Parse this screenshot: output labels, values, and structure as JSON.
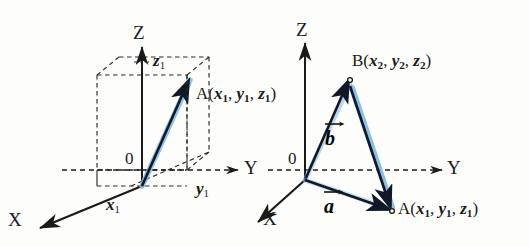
{
  "figure": {
    "caption_clipped": "(x₂ - x₁, y₂ - y₁, z₂ - z₁)",
    "background_color": "#fdfdfc",
    "ink_color": "#1a1a1a",
    "vector_line_color": "#111827",
    "vector_highlight_color": "#7fb8e0",
    "dashed_color": "#2b2b2b"
  },
  "left_diagram": {
    "name": "position-vector-in-box",
    "axes": {
      "z_label": "Z",
      "y_label": "Y",
      "x_label": "X"
    },
    "origin_label": "0",
    "ticks": {
      "z": "z",
      "z_sub": "1",
      "y": "y",
      "y_sub": "1",
      "x": "x",
      "x_sub": "1"
    },
    "point": {
      "name": "A",
      "open_paren": "(",
      "c1": "x",
      "c1_sub": "1",
      "sep1": ", ",
      "c2": "y",
      "c2_sub": "1",
      "sep2": ", ",
      "c3": "z",
      "c3_sub": "1",
      "close_paren": ")"
    }
  },
  "right_diagram": {
    "name": "two-position-vectors",
    "axes": {
      "z_label": "Z",
      "y_label": "Y",
      "x_label": "X"
    },
    "origin_label": "0",
    "point_b": {
      "name": "B",
      "open_paren": "(",
      "c1": "x",
      "c1_sub": "2",
      "sep1": ", ",
      "c2": "y",
      "c2_sub": "2",
      "sep2": ", ",
      "c3": "z",
      "c3_sub": "2",
      "close_paren": ")"
    },
    "point_a": {
      "name": "A",
      "open_paren": "(",
      "c1": "x",
      "c1_sub": "1",
      "sep1": ", ",
      "c2": "y",
      "c2_sub": "1",
      "sep2": ", ",
      "c3": "z",
      "c3_sub": "1",
      "close_paren": ")"
    },
    "vector_b_label": "b",
    "vector_a_label": "a"
  }
}
